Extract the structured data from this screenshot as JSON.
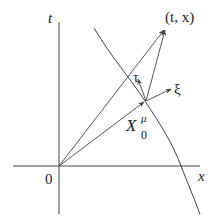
{
  "diagram": {
    "type": "spacetime-diagram",
    "axes": {
      "vertical_label": "t",
      "horizontal_label": "x",
      "origin_label": "0"
    },
    "labels": {
      "event_point": "(t, x)",
      "tau_vector": "τ",
      "xi_vector": "ξ",
      "base_point_main": "X",
      "base_point_sup": "μ",
      "base_point_sub": "0"
    },
    "elements": [
      {
        "name": "t-axis",
        "kind": "line"
      },
      {
        "name": "x-axis",
        "kind": "line"
      },
      {
        "name": "worldline-curve",
        "kind": "curve"
      },
      {
        "name": "vector-origin-to-event",
        "kind": "arrow",
        "to": "(t, x)"
      },
      {
        "name": "vector-origin-to-X0",
        "kind": "arrow",
        "to": "X0^μ"
      },
      {
        "name": "vector-X0-to-event",
        "kind": "arrow",
        "to": "(t, x)"
      },
      {
        "name": "tau-vector",
        "kind": "arrow",
        "label": "τ"
      },
      {
        "name": "xi-vector",
        "kind": "arrow",
        "label": "ξ"
      }
    ],
    "colors": {
      "stroke": "#444444",
      "text": "#222222",
      "background": "#ffffff"
    }
  }
}
